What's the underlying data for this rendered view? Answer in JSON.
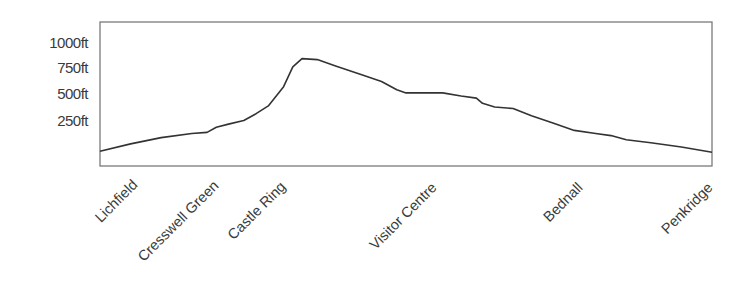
{
  "chart_data": {
    "type": "line",
    "title": "",
    "xlabel": "",
    "ylabel": "",
    "ylim": [
      -50,
      1300
    ],
    "grid": false,
    "legend": null,
    "y_ticks": [
      {
        "label": "1000ft",
        "value": 1000
      },
      {
        "label": "750ft",
        "value": 750
      },
      {
        "label": "500ft",
        "value": 500
      },
      {
        "label": "250ft",
        "value": 250
      }
    ],
    "x_ticks": [
      {
        "label": "Lichfield",
        "position": 0.05
      },
      {
        "label": "Cresswell Green",
        "position": 0.18
      },
      {
        "label": "Castle Ring",
        "position": 0.29
      },
      {
        "label": "Visitor Centre",
        "position": 0.54
      },
      {
        "label": "Bednall",
        "position": 0.78
      },
      {
        "label": "Penkridge",
        "position": 0.99
      }
    ],
    "series": [
      {
        "name": "Elevation profile",
        "color": "#333333",
        "x": [
          0.0,
          0.05,
          0.1,
          0.15,
          0.175,
          0.19,
          0.21,
          0.235,
          0.255,
          0.275,
          0.3,
          0.315,
          0.33,
          0.355,
          0.385,
          0.43,
          0.46,
          0.485,
          0.5,
          0.52,
          0.56,
          0.59,
          0.615,
          0.625,
          0.645,
          0.675,
          0.705,
          0.74,
          0.775,
          0.81,
          0.835,
          0.86,
          0.9,
          0.95,
          1.0
        ],
        "values": [
          -40,
          30,
          90,
          130,
          140,
          190,
          220,
          255,
          320,
          395,
          580,
          770,
          850,
          840,
          780,
          690,
          630,
          550,
          520,
          520,
          520,
          490,
          470,
          420,
          385,
          370,
          300,
          230,
          160,
          130,
          110,
          70,
          40,
          0,
          -50
        ]
      }
    ]
  },
  "colors": {
    "line": "#333333",
    "border": "#7a7a7a",
    "text": "#3a3a3a",
    "background": "#ffffff"
  }
}
